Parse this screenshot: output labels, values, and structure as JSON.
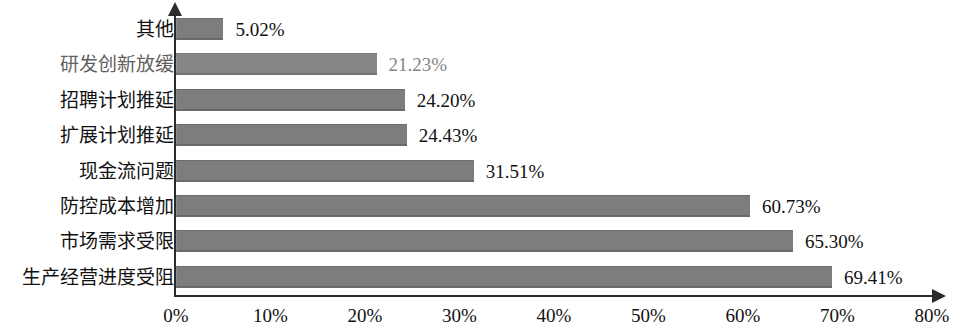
{
  "chart_data": {
    "type": "bar",
    "orientation": "horizontal",
    "title": "",
    "xlabel": "",
    "ylabel": "",
    "xlim": [
      0,
      80
    ],
    "xtick_labels": [
      "0%",
      "10%",
      "20%",
      "30%",
      "40%",
      "50%",
      "60%",
      "70%",
      "80%"
    ],
    "xtick_values": [
      0,
      10,
      20,
      30,
      40,
      50,
      60,
      70,
      80
    ],
    "grid": false,
    "legend": false,
    "bar_color": "#7c7c7c",
    "axis_color": "#2b2b2b",
    "categories": [
      "其他",
      "研发创新放缓",
      "招聘计划推延",
      "扩展计划推延",
      "现金流问题",
      "防控成本增加",
      "市场需求受限",
      "生产经营进度受阻"
    ],
    "values": [
      5.02,
      21.23,
      24.2,
      24.43,
      31.51,
      60.73,
      65.3,
      69.41
    ],
    "value_labels": [
      "5.02%",
      "21.23%",
      "24.20%",
      "24.43%",
      "31.51%",
      "60.73%",
      "65.30%",
      "69.41%"
    ]
  }
}
